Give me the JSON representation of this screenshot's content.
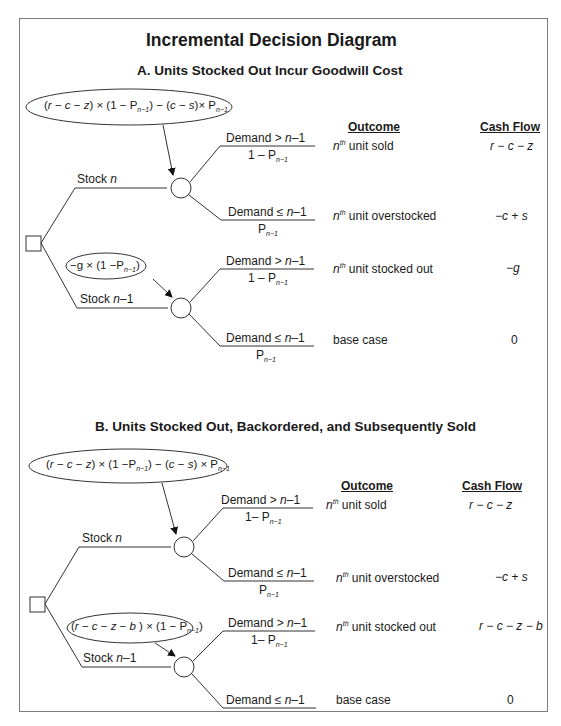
{
  "title": "Incremental Decision Diagram",
  "panels": [
    {
      "heading": "A. Units Stocked Out Incur Goodwill Cost",
      "columns": {
        "outcome": "Outcome",
        "cash_flow": "Cash Flow"
      },
      "top_formula": "(r − c − z) × (1 − P_{n−1}) − (c − s) × P_{n−1}",
      "bottom_formula": "−g × (1 − P_{n−1})",
      "decisions": [
        {
          "label": "Stock n",
          "branches": [
            {
              "event": "Demand > n−1",
              "prob": "1 − P_{n−1}",
              "outcome": "nth unit sold",
              "cash_flow": "r − c − z"
            },
            {
              "event": "Demand ≤ n−1",
              "prob": "P_{n−1}",
              "outcome": "nth unit overstocked",
              "cash_flow": "−c + s"
            }
          ]
        },
        {
          "label": "Stock n−1",
          "branches": [
            {
              "event": "Demand > n−1",
              "prob": "1 − P_{n−1}",
              "outcome": "nth unit stocked out",
              "cash_flow": "−g"
            },
            {
              "event": "Demand ≤ n−1",
              "prob": "P_{n−1}",
              "outcome": "base case",
              "cash_flow": "0"
            }
          ]
        }
      ]
    },
    {
      "heading": "B. Units Stocked Out, Backordered, and Subsequently Sold",
      "columns": {
        "outcome": "Outcome",
        "cash_flow": "Cash Flow"
      },
      "top_formula": "(r − c − z) × (1 − P_{n−1}) − (c − s) × P_{n−1}",
      "bottom_formula": "(r − c − z − b) × (1 − P_{n−1})",
      "decisions": [
        {
          "label": "Stock n",
          "branches": [
            {
              "event": "Demand > n−1",
              "prob": "1− P_{n−1}",
              "outcome": "nth unit sold",
              "cash_flow": "r − c − z"
            },
            {
              "event": "Demand ≤ n−1",
              "prob": "P_{n−1}",
              "outcome": "nth unit overstocked",
              "cash_flow": "−c + s"
            }
          ]
        },
        {
          "label": "Stock n−1",
          "branches": [
            {
              "event": "Demand > n−1",
              "prob": "1− P_{n−1}",
              "outcome": "nth unit stocked out",
              "cash_flow": "r − c − z − b"
            },
            {
              "event": "Demand ≤ n−1",
              "prob": "",
              "outcome": "base case",
              "cash_flow": "0"
            }
          ]
        }
      ]
    }
  ],
  "strings": {
    "demand": "Demand",
    "stock": "Stock",
    "n": "n",
    "nminus1": "n−1",
    "gt": ">",
    "le": "≤",
    "one_minus_P": "1 − P",
    "one_minus_P_b": "1− P",
    "P": "P",
    "sub_n1": "n−1",
    "th": "th",
    "unit_sold": " unit sold",
    "unit_overstocked": " unit overstocked",
    "unit_stocked_out": " unit stocked out",
    "base_case": "base case"
  }
}
